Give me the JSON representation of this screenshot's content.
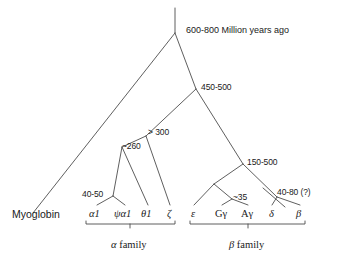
{
  "figure": {
    "type": "phylogenetic-tree",
    "background_color": "#ffffff",
    "line_color": "#4d4d4d",
    "text_color": "#1a1a1a"
  },
  "root": {
    "label": "600-800 Million years ago"
  },
  "nodes": [
    {
      "id": "root",
      "label": "600-800 Million years ago",
      "x": 175,
      "y": 33
    },
    {
      "id": "globin",
      "label": "450-500",
      "x": 196,
      "y": 89
    },
    {
      "id": "alpha_zeta",
      "label": "> 300",
      "x": 146,
      "y": 136
    },
    {
      "id": "alpha_theta",
      "label": "~260",
      "x": 122,
      "y": 147
    },
    {
      "id": "alpha_dup",
      "label": "40-50",
      "x": 113,
      "y": 196
    },
    {
      "id": "beta_root",
      "label": "150-500",
      "x": 243,
      "y": 164
    },
    {
      "id": "gamma_dup",
      "label": "~35",
      "x": 232,
      "y": 199
    },
    {
      "id": "delta_beta",
      "label": "40-80 (?)",
      "x": 277,
      "y": 197
    }
  ],
  "leaves": {
    "outgroup": {
      "label": "Myoglobin",
      "x": 33,
      "y": 213
    },
    "alpha_family": [
      {
        "label": "α1",
        "x": 97,
        "y": 213
      },
      {
        "label": "ψα1",
        "x": 125,
        "y": 213
      },
      {
        "label": "θ1",
        "x": 148,
        "y": 213
      },
      {
        "label": "ζ",
        "x": 170,
        "y": 213
      }
    ],
    "beta_family": [
      {
        "label": "ε",
        "x": 194,
        "y": 213
      },
      {
        "label": "Gγ",
        "x": 222,
        "y": 213
      },
      {
        "label": "Aγ",
        "x": 248,
        "y": 213
      },
      {
        "label": "δ",
        "x": 272,
        "y": 213
      },
      {
        "label": "β",
        "x": 300,
        "y": 213
      }
    ]
  },
  "brackets": [
    {
      "id": "alpha-bracket",
      "label": "α family",
      "greek": "α",
      "word": " family",
      "x1": 86,
      "x2": 175,
      "y": 224,
      "label_x": 130,
      "label_y": 246
    },
    {
      "id": "beta-bracket",
      "label": "β family",
      "greek": "β",
      "word": " family",
      "x1": 190,
      "x2": 305,
      "y": 224,
      "label_x": 248,
      "label_y": 246
    }
  ],
  "node_labels": {
    "root_age": "600-800 Million years ago",
    "globin_age": "450-500",
    "alpha_zeta_age": "> 300",
    "alpha_theta_age": "~260",
    "alpha_dup_age": "40-50",
    "beta_root_age": "150-500",
    "gamma_dup_age": "~35",
    "delta_beta_age": "40-80 (?)"
  },
  "leaf_labels": {
    "myoglobin": "Myoglobin",
    "alpha1": "α1",
    "psi_alpha1": "ψα1",
    "theta1": "θ1",
    "zeta": "ζ",
    "epsilon": "ε",
    "g_gamma": "Gγ",
    "a_gamma": "Aγ",
    "delta": "δ",
    "beta": "β"
  },
  "family_labels": {
    "alpha_greek": "α",
    "alpha_word": " family",
    "beta_greek": "β",
    "beta_word": " family"
  }
}
